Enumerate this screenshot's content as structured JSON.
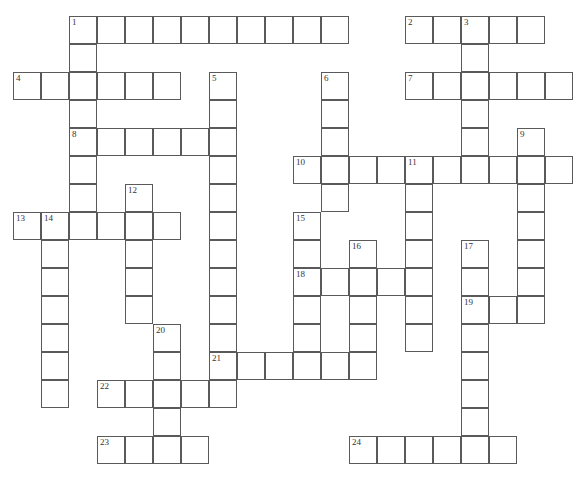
{
  "puzzle": {
    "type": "crossword",
    "cell_size": 28,
    "origin": {
      "x": 13,
      "y": 16
    },
    "entries": [
      {
        "number": "1",
        "direction": "across",
        "row": 0,
        "col": 2,
        "length": 10
      },
      {
        "number": "1",
        "direction": "down",
        "row": 0,
        "col": 2,
        "length": 8
      },
      {
        "number": "2",
        "direction": "across",
        "row": 0,
        "col": 14,
        "length": 5
      },
      {
        "number": "3",
        "direction": "down",
        "row": 0,
        "col": 16,
        "length": 6
      },
      {
        "number": "4",
        "direction": "across",
        "row": 2,
        "col": 0,
        "length": 6
      },
      {
        "number": "5",
        "direction": "down",
        "row": 2,
        "col": 7,
        "length": 11
      },
      {
        "number": "6",
        "direction": "down",
        "row": 2,
        "col": 11,
        "length": 5
      },
      {
        "number": "7",
        "direction": "across",
        "row": 2,
        "col": 14,
        "length": 6
      },
      {
        "number": "8",
        "direction": "across",
        "row": 4,
        "col": 2,
        "length": 6
      },
      {
        "number": "9",
        "direction": "down",
        "row": 4,
        "col": 18,
        "length": 7
      },
      {
        "number": "10",
        "direction": "across",
        "row": 5,
        "col": 10,
        "length": 10
      },
      {
        "number": "11",
        "direction": "down",
        "row": 5,
        "col": 14,
        "length": 7
      },
      {
        "number": "12",
        "direction": "down",
        "row": 6,
        "col": 4,
        "length": 5
      },
      {
        "number": "13",
        "direction": "across",
        "row": 7,
        "col": 0,
        "length": 6
      },
      {
        "number": "14",
        "direction": "down",
        "row": 7,
        "col": 1,
        "length": 7
      },
      {
        "number": "15",
        "direction": "down",
        "row": 7,
        "col": 10,
        "length": 6
      },
      {
        "number": "16",
        "direction": "down",
        "row": 8,
        "col": 12,
        "length": 5
      },
      {
        "number": "17",
        "direction": "down",
        "row": 8,
        "col": 16,
        "length": 8
      },
      {
        "number": "18",
        "direction": "across",
        "row": 9,
        "col": 10,
        "length": 5
      },
      {
        "number": "19",
        "direction": "across",
        "row": 10,
        "col": 16,
        "length": 3
      },
      {
        "number": "20",
        "direction": "down",
        "row": 11,
        "col": 5,
        "length": 5
      },
      {
        "number": "21",
        "direction": "across",
        "row": 12,
        "col": 7,
        "length": 6
      },
      {
        "number": "22",
        "direction": "across",
        "row": 13,
        "col": 3,
        "length": 5
      },
      {
        "number": "23",
        "direction": "across",
        "row": 15,
        "col": 3,
        "length": 4
      },
      {
        "number": "24",
        "direction": "across",
        "row": 15,
        "col": 12,
        "length": 6
      }
    ],
    "colors": {
      "border": "#5a5a5a",
      "cell": "#ffffff",
      "number": "#333333",
      "background": "#ffffff"
    }
  }
}
